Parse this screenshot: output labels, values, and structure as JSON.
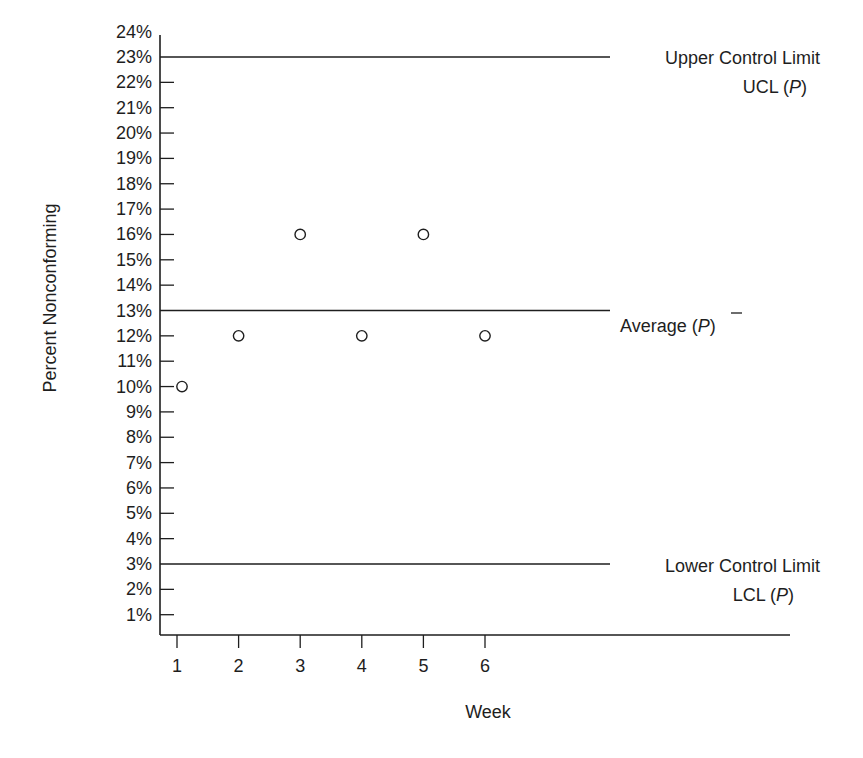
{
  "chart_data": {
    "type": "scatter",
    "title": "",
    "xlabel": "Week",
    "ylabel": "Percent Nonconforming",
    "x": [
      1,
      2,
      3,
      4,
      5,
      6
    ],
    "series": [
      {
        "name": "Percent Nonconforming",
        "values": [
          10,
          12,
          16,
          12,
          16,
          12
        ],
        "marker": "open-circle"
      }
    ],
    "x_ticks": [
      "1",
      "2",
      "3",
      "4",
      "5",
      "6"
    ],
    "y_ticks": [
      "1%",
      "2%",
      "3%",
      "4%",
      "5%",
      "6%",
      "7%",
      "8%",
      "9%",
      "10%",
      "11%",
      "12%",
      "13%",
      "14%",
      "15%",
      "16%",
      "17%",
      "18%",
      "19%",
      "20%",
      "21%",
      "22%",
      "23%",
      "24%"
    ],
    "ylim": [
      0,
      24
    ],
    "xlim": [
      0.7,
      10.8
    ],
    "grid": false,
    "reference_lines": [
      {
        "name": "Upper Control Limit",
        "value": 23,
        "label_line1": "Upper Control Limit",
        "label_line2": "UCL (P)"
      },
      {
        "name": "Average",
        "value": 13,
        "label_line1": "Average  (P̄)",
        "label_line2": ""
      },
      {
        "name": "Lower Control Limit",
        "value": 3,
        "label_line1": "Lower Control Limit",
        "label_line2": "LCL (P)"
      }
    ],
    "colors": {
      "ink": "#1e1e1e",
      "background": "#ffffff"
    }
  },
  "labels": {
    "ylabel": "Percent Nonconforming",
    "xlabel": "Week",
    "ucl_line1": "Upper Control Limit",
    "ucl_line2_prefix": "UCL (",
    "ucl_line2_var": "P",
    "ucl_line2_suffix": ")",
    "avg_prefix": "Average  (",
    "avg_var": "P",
    "avg_suffix": ")",
    "lcl_line1": "Lower Control Limit",
    "lcl_line2_prefix": "LCL  (",
    "lcl_line2_var": "P",
    "lcl_line2_suffix": ")"
  }
}
